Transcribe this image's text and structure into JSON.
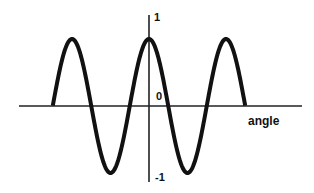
{
  "chart_data": {
    "type": "line",
    "title": "",
    "xlabel": "angle",
    "ylabel": "",
    "function": "cos(angle)",
    "x_range_radians": [
      -7.85,
      7.85
    ],
    "ylim": [
      -1,
      1
    ],
    "y_ticks": [
      {
        "value": 1,
        "label": "1"
      },
      {
        "value": 0,
        "label": "0"
      },
      {
        "value": -1,
        "label": "-1"
      }
    ],
    "x_ticks": [],
    "grid": false,
    "legend": null,
    "series": [
      {
        "name": "cosine",
        "color": "#111111",
        "x": [
          -7.85,
          -6.28,
          -4.71,
          -3.14,
          -1.57,
          0,
          1.57,
          3.14,
          4.71,
          6.28,
          7.85
        ],
        "values": [
          0,
          1,
          0,
          -1,
          0,
          1,
          0,
          -1,
          0,
          1,
          0
        ]
      }
    ]
  },
  "labels": {
    "x_axis": "angle",
    "y_max": "1",
    "y_zero": "0",
    "y_min": "-1"
  },
  "colors": {
    "background": "#ffffff",
    "axis": "#222222",
    "curve": "#111111"
  }
}
